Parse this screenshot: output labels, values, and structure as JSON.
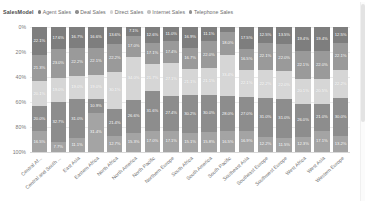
{
  "legend": {
    "title": "SalesModel",
    "items": [
      {
        "label": "Agent Sales",
        "color": "#7b7b7b",
        "icon": "legend-dot-icon"
      },
      {
        "label": "Deal Sales",
        "color": "#8f8f8f",
        "icon": "legend-dot-icon"
      },
      {
        "label": "Direct Sales",
        "color": "#d3d3d3",
        "icon": "legend-dot-icon"
      },
      {
        "label": "Internet Sales",
        "color": "#c2c2c2",
        "icon": "legend-dot-icon"
      },
      {
        "label": "Telephone Sales",
        "color": "#909090",
        "icon": "legend-dot-icon"
      }
    ]
  },
  "yaxis": {
    "ticks": [
      "100%",
      "80%",
      "60%",
      "40%",
      "20%",
      "0%"
    ]
  },
  "scrollbars": {
    "vertical_thumb": "vertical-scrollbar-thumb",
    "vertical_track": "vertical-scrollbar-track"
  },
  "chart_data": {
    "type": "bar",
    "subtype": "100% stacked column",
    "title": "SalesModel",
    "xlabel": "",
    "ylabel": "",
    "ylim": [
      0,
      100
    ],
    "ytick_values": [
      0,
      20,
      40,
      60,
      80,
      100
    ],
    "ytick_labels": [
      "0%",
      "20%",
      "40%",
      "60%",
      "80%",
      "100%"
    ],
    "grid": true,
    "legend_position": "top-left",
    "stack_order_bottom_to_top": [
      "Telephone Sales",
      "Internet Sales",
      "Direct Sales",
      "Deal Sales",
      "Agent Sales"
    ],
    "categories": [
      "Central Af...",
      "Central and South ...",
      "East Asia",
      "Eastern Africa",
      "North Africa",
      "North America",
      "North Pacific",
      "Northern Europe",
      "South Africa",
      "South America",
      "South Pacific",
      "Southeast Asia",
      "Southeast Europe",
      "Southwest Europe",
      "West Africa",
      "West Asia",
      "Western Europe"
    ],
    "series": [
      {
        "name": "Agent Sales",
        "color": "#7e7e7e",
        "values": [
          22.1,
          17.6,
          16.7,
          16.6,
          13.6,
          7.1,
          12.6,
          11.0,
          16.9,
          11.1,
          4.1,
          17.5,
          12.5,
          13.5,
          19.4,
          19.4,
          12.5
        ],
        "labels": [
          "22.1%",
          "17.6%",
          "16.7%",
          "16.6%",
          "13.6%",
          "7.1%",
          "12.6%",
          "11.0%",
          "16.9%",
          "11.1%",
          "4.1%",
          "17.5%",
          "12.5%",
          "13.5%",
          "19.4%",
          "19.4%",
          "12.5%"
        ]
      },
      {
        "name": "Deal Sales",
        "color": "#9a9a9a",
        "values": [
          21.3,
          23.0,
          22.2,
          22.1,
          22.2,
          17.0,
          17.1,
          17.4,
          16.7,
          22.0,
          18.0,
          16.5,
          22.1,
          22.0,
          22.1,
          22.0,
          22.1
        ],
        "labels": [
          "21.3%",
          "23.0%",
          "22.2%",
          "22.1%",
          "22.2%",
          "17.0%",
          "17.1%",
          "17.4%",
          "16.7%",
          "22.0%",
          "18.0%",
          "16.5%",
          "22.1%",
          "22.0%",
          "22.1%",
          "22.0%",
          "22.1%"
        ]
      },
      {
        "name": "Direct Sales",
        "color": "#d6d6d6",
        "values": [
          20.1,
          19.0,
          19.0,
          19.0,
          30.1,
          34.0,
          21.7,
          27.1,
          21.1,
          21.1,
          33.4,
          22.1,
          22.2,
          22.0,
          20.1,
          20.5,
          22.2
        ],
        "labels": [
          "20.1%",
          "19.0%",
          "19.0%",
          "19.0%",
          "30.1%",
          "34.0%",
          "21.7%",
          "27.1%",
          "21.1%",
          "21.1%",
          "33.4%",
          "22.1%",
          "22.2%",
          "22.0%",
          "20.1%",
          "20.5%",
          "22.2%"
        ]
      },
      {
        "name": "Internet Sales",
        "color": "#8d8d8d",
        "values": [
          20.0,
          32.7,
          31.0,
          10.9,
          21.4,
          26.6,
          31.6,
          27.4,
          30.2,
          30.0,
          28.0,
          27.0,
          31.0,
          31.0,
          26.0,
          21.0,
          30.0
        ],
        "labels": [
          "20.0%",
          "32.7%",
          "31.0%",
          "10.9%",
          "21.4%",
          "26.6%",
          "31.6%",
          "27.4%",
          "30.2%",
          "30.0%",
          "28.0%",
          "27.0%",
          "31.0%",
          "31.0%",
          "26.0%",
          "21.0%",
          "30.0%"
        ]
      },
      {
        "name": "Telephone Sales",
        "color": "#a4a4a4",
        "values": [
          16.5,
          7.7,
          11.1,
          31.4,
          12.7,
          15.3,
          17.0,
          17.1,
          15.1,
          15.8,
          16.5,
          16.9,
          12.2,
          11.5,
          12.3,
          17.1,
          13.2
        ],
        "labels": [
          "16.5%",
          "7.7%",
          "11.1%",
          "31.4%",
          "12.7%",
          "15.3%",
          "17.0%",
          "17.1%",
          "15.1%",
          "15.8%",
          "16.5%",
          "16.9%",
          "12.2%",
          "11.5%",
          "12.3%",
          "17.1%",
          "13.2%"
        ]
      }
    ]
  }
}
